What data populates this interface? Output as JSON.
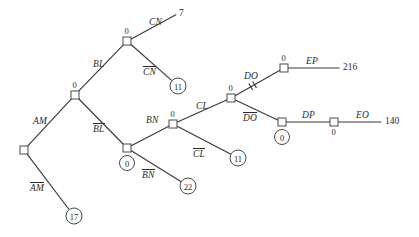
{
  "diagram": {
    "type": "decision-tree",
    "width": 419,
    "height": 237,
    "background_color": "#ffffff",
    "line_color": "#3a3a3a",
    "text_color": "#2b2b2b",
    "decision_nodes": [
      {
        "id": "root",
        "x": 24,
        "y": 150,
        "value": "",
        "value_pos": "none"
      },
      {
        "id": "am",
        "x": 75,
        "y": 95,
        "value": "0",
        "value_pos": "above"
      },
      {
        "id": "bl",
        "x": 127,
        "y": 41,
        "value": "0",
        "value_pos": "above"
      },
      {
        "id": "blbar",
        "x": 127,
        "y": 148,
        "value": "0",
        "value_pos": "circled-below"
      },
      {
        "id": "bn",
        "x": 173,
        "y": 124,
        "value": "0",
        "value_pos": "above"
      },
      {
        "id": "cl",
        "x": 231,
        "y": 98,
        "value": "0",
        "value_pos": "above"
      },
      {
        "id": "do",
        "x": 284,
        "y": 68,
        "value": "0",
        "value_pos": "above"
      },
      {
        "id": "dobar",
        "x": 282,
        "y": 122,
        "value": "0",
        "value_pos": "circled-below"
      },
      {
        "id": "dp",
        "x": 334,
        "y": 122,
        "value": "0",
        "value_pos": "below"
      }
    ],
    "terminal_circles": [
      {
        "id": "t17",
        "x": 74,
        "y": 216,
        "value": "17"
      },
      {
        "id": "t11a",
        "x": 178,
        "y": 86,
        "value": "11"
      },
      {
        "id": "t22",
        "x": 188,
        "y": 186,
        "value": "22"
      },
      {
        "id": "t11b",
        "x": 238,
        "y": 158,
        "value": "11"
      }
    ],
    "payoffs": [
      {
        "id": "p7",
        "x": 184,
        "y": 14,
        "value": "7"
      },
      {
        "id": "p216",
        "x": 348,
        "y": 68,
        "value": "216"
      },
      {
        "id": "p140",
        "x": 390,
        "y": 122,
        "value": "140"
      }
    ],
    "edges": [
      {
        "id": "edge-am",
        "from": "root",
        "to": "am",
        "label": "AM",
        "overbar": false,
        "pruned": false,
        "label_x": 33,
        "label_y": 117
      },
      {
        "id": "edge-ambar",
        "from": "root",
        "to": "t17",
        "label": "AM",
        "overbar": true,
        "pruned": false,
        "label_x": 30,
        "label_y": 182
      },
      {
        "id": "edge-bl",
        "from": "am",
        "to": "bl",
        "label": "BL",
        "overbar": false,
        "pruned": false,
        "label_x": 93,
        "label_y": 60
      },
      {
        "id": "edge-blbar",
        "from": "am",
        "to": "blbar",
        "label": "BL",
        "overbar": true,
        "pruned": false,
        "label_x": 93,
        "label_y": 123
      },
      {
        "id": "edge-cn",
        "from": "bl",
        "to": "p7",
        "label": "CN",
        "overbar": false,
        "pruned": false,
        "label_x": 149,
        "label_y": 18
      },
      {
        "id": "edge-cnbar",
        "from": "bl",
        "to": "t11a",
        "label": "CN",
        "overbar": true,
        "pruned": false,
        "label_x": 143,
        "label_y": 66
      },
      {
        "id": "edge-bn",
        "from": "blbar",
        "to": "bn",
        "label": "BN",
        "overbar": false,
        "pruned": false,
        "label_x": 146,
        "label_y": 116
      },
      {
        "id": "edge-bnbar",
        "from": "blbar",
        "to": "t22",
        "label": "BN",
        "overbar": true,
        "pruned": false,
        "label_x": 142,
        "label_y": 169
      },
      {
        "id": "edge-cl",
        "from": "bn",
        "to": "cl",
        "label": "CL",
        "overbar": false,
        "pruned": false,
        "label_x": 196,
        "label_y": 102
      },
      {
        "id": "edge-clbar",
        "from": "bn",
        "to": "t11b",
        "label": "CL",
        "overbar": true,
        "pruned": false,
        "label_x": 193,
        "label_y": 148
      },
      {
        "id": "edge-do",
        "from": "cl",
        "to": "do",
        "label": "DO",
        "overbar": false,
        "pruned": true,
        "label_x": 244,
        "label_y": 72
      },
      {
        "id": "edge-dobar",
        "from": "cl",
        "to": "dobar",
        "label": "DO",
        "overbar": true,
        "pruned": false,
        "label_x": 243,
        "label_y": 112
      },
      {
        "id": "edge-ep",
        "from": "do",
        "to": "p216",
        "label": "EP",
        "overbar": false,
        "pruned": false,
        "label_x": 306,
        "label_y": 57
      },
      {
        "id": "edge-dp",
        "from": "dobar",
        "to": "dp",
        "label": "DP",
        "overbar": false,
        "pruned": false,
        "label_x": 302,
        "label_y": 111
      },
      {
        "id": "edge-eo",
        "from": "dp",
        "to": "p140",
        "label": "EO",
        "overbar": false,
        "pruned": false,
        "label_x": 356,
        "label_y": 111
      }
    ]
  }
}
